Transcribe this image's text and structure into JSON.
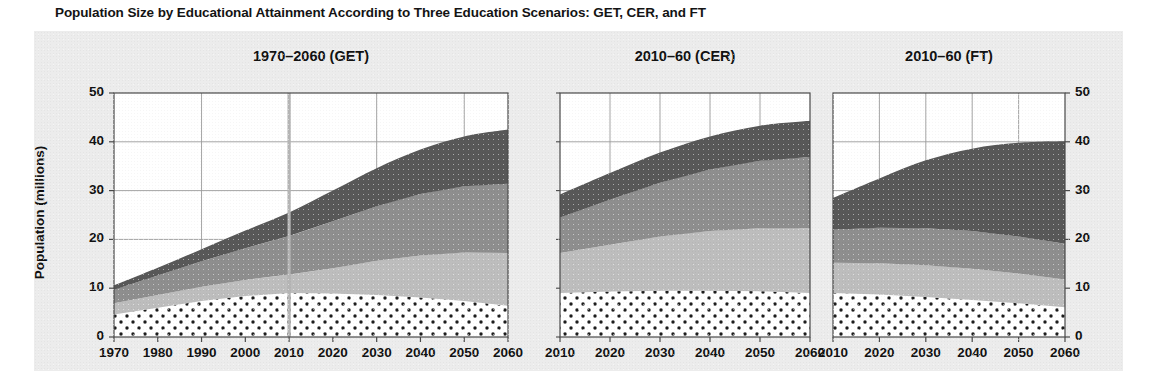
{
  "figure": {
    "title": "Population Size by Educational Attainment According to Three Education Scenarios: GET, CER, and FT",
    "ylabel": "Population (millions)"
  },
  "colors": {
    "background": "#ffffff",
    "plate": "#ececec",
    "panel_bg": "#ffffff",
    "axis": "#4a4a4a",
    "grid": "#9a9a9a",
    "layer_dotted_fill": "#ffffff",
    "layer_dotted_dot": "#1d1d1d",
    "layer_light": "#bdbdbd",
    "layer_medium": "#8e8e8e",
    "layer_dark": "#585858",
    "divider_line": "#b4b4b4"
  },
  "chart_data": {
    "type": "area",
    "title": "Population Size by Educational Attainment According to Three Education Scenarios: GET, CER, and FT",
    "ylabel": "Population (millions)",
    "xlabel": "",
    "ylim": [
      0,
      50
    ],
    "yticks": [
      0,
      10,
      20,
      30,
      40,
      50
    ],
    "grid": true,
    "legend_position": "none",
    "stacked": true,
    "series_names": [
      "No education / primary",
      "Lower secondary",
      "Upper secondary",
      "Post-secondary"
    ],
    "panels": [
      {
        "name": "GET",
        "title": "1970–2060 (GET)",
        "x": [
          1970,
          1980,
          1990,
          2000,
          2010,
          2020,
          2030,
          2040,
          2050,
          2060
        ],
        "xticks": [
          1970,
          1980,
          1990,
          2000,
          2010,
          2020,
          2030,
          2040,
          2050,
          2060
        ],
        "annotation_vline_year": 2010,
        "series": [
          {
            "name": "No education / primary",
            "values": [
              4.6,
              6.0,
              7.4,
              8.4,
              9.0,
              8.9,
              8.6,
              8.1,
              7.4,
              6.4
            ]
          },
          {
            "name": "Lower secondary",
            "values": [
              2.3,
              2.6,
              2.9,
              3.3,
              3.8,
              5.2,
              7.0,
              8.6,
              9.9,
              10.8
            ]
          },
          {
            "name": "Upper secondary",
            "values": [
              2.8,
              4.0,
              5.2,
              6.5,
              7.9,
              9.6,
              11.2,
              12.6,
              13.6,
              14.2
            ]
          },
          {
            "name": "Post-secondary",
            "values": [
              0.9,
              1.6,
              2.5,
              3.6,
              4.8,
              6.3,
              7.8,
              9.1,
              10.2,
              11.1
            ]
          }
        ],
        "totals": [
          10.6,
          14.2,
          18.0,
          21.8,
          25.5,
          30.0,
          34.6,
          38.4,
          41.1,
          42.5
        ]
      },
      {
        "name": "CER",
        "title": "2010–60 (CER)",
        "x": [
          2010,
          2020,
          2030,
          2040,
          2050,
          2060
        ],
        "xticks": [
          2010,
          2020,
          2030,
          2040,
          2050,
          2060
        ],
        "series": [
          {
            "name": "No education / primary",
            "values": [
              9.0,
              9.3,
              9.5,
              9.5,
              9.4,
              9.0
            ]
          },
          {
            "name": "Lower secondary",
            "values": [
              8.2,
              9.6,
              11.1,
              12.2,
              12.9,
              13.3
            ]
          },
          {
            "name": "Upper secondary",
            "values": [
              7.3,
              9.2,
              11.0,
              12.6,
              13.8,
              14.6
            ]
          },
          {
            "name": "Post-secondary",
            "values": [
              4.7,
              5.5,
              6.2,
              6.8,
              7.2,
              7.4
            ]
          }
        ],
        "totals": [
          29.2,
          33.6,
          37.8,
          41.1,
          43.3,
          44.3
        ]
      },
      {
        "name": "FT",
        "title": "2010–60 (FT)",
        "x": [
          2010,
          2020,
          2030,
          2040,
          2050,
          2060
        ],
        "xticks": [
          2010,
          2020,
          2030,
          2040,
          2050,
          2060
        ],
        "series": [
          {
            "name": "No education / primary",
            "values": [
              9.0,
              8.7,
              8.2,
              7.6,
              6.9,
              6.1
            ]
          },
          {
            "name": "Lower secondary",
            "values": [
              6.2,
              6.4,
              6.5,
              6.4,
              6.1,
              5.7
            ]
          },
          {
            "name": "Upper secondary",
            "values": [
              6.8,
              7.3,
              7.6,
              7.7,
              7.6,
              7.3
            ]
          },
          {
            "name": "Post-secondary",
            "values": [
              6.5,
              10.1,
              13.9,
              16.9,
              19.2,
              21.0
            ]
          }
        ],
        "totals": [
          28.5,
          32.5,
          36.2,
          38.6,
          39.8,
          40.1
        ]
      }
    ]
  },
  "axes": {
    "ytick_labels": [
      "0",
      "10",
      "20",
      "30",
      "40",
      "50"
    ],
    "panel1_xtick_labels": [
      "1970",
      "1980",
      "1990",
      "2000",
      "2010",
      "2020",
      "2030",
      "2040",
      "2050",
      "2060"
    ],
    "panel2_xtick_labels": [
      "2010",
      "2020",
      "2030",
      "2040",
      "2050",
      "2060"
    ],
    "panel3_xtick_labels": [
      "2010",
      "2020",
      "2030",
      "2040",
      "2050",
      "2060"
    ]
  }
}
